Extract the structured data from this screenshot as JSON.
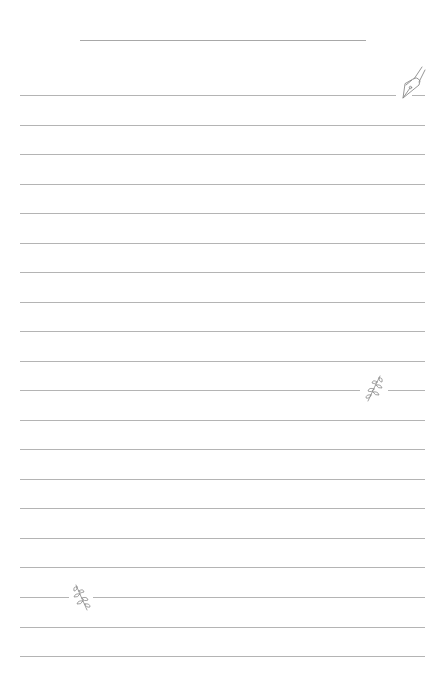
{
  "page": {
    "type": "lined-notebook-paper",
    "background_color": "#ffffff",
    "line_color": "#b4b4b4",
    "title_line_color": "#a8a8a8",
    "title_line": {
      "x_start": 80,
      "x_end": 366,
      "y": 40
    },
    "rules": {
      "count": 20,
      "x_start": 20,
      "x_end": 425,
      "first_y": 95,
      "spacing": 29.53
    }
  },
  "decorations": [
    {
      "icon": "fountain-pen-nib-icon",
      "line_index": 0,
      "x": 397,
      "y": 68,
      "gap": [
        396,
        412
      ]
    },
    {
      "icon": "leaf-sprig-icon",
      "line_index": 10,
      "x": 363,
      "y": 375,
      "gap": [
        360,
        388
      ]
    },
    {
      "icon": "leaf-sprig-icon",
      "line_index": 17,
      "x": 71,
      "y": 584,
      "gap": [
        69,
        93
      ]
    }
  ]
}
